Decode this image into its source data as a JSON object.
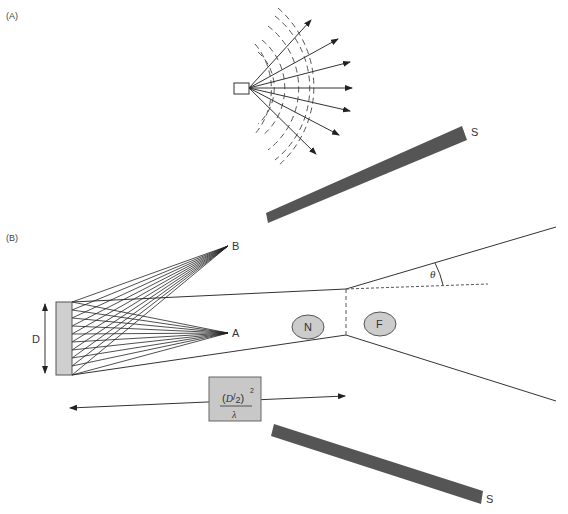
{
  "panel_a": {
    "label": "(A)",
    "surface_label": "S"
  },
  "panel_b": {
    "label": "(B)",
    "point_b_label": "B",
    "point_a_label": "A",
    "aperture_label": "D",
    "near_field_label": "N",
    "far_field_label": "F",
    "angle_label": "θ",
    "distance_formula": {
      "numerator_open": "(",
      "numerator_d": "D",
      "numerator_slash": "/",
      "numerator_two": "2",
      "numerator_close": ")",
      "exponent": "2",
      "denominator": "λ"
    },
    "surface_label": "S"
  },
  "colors": {
    "line": "#333333",
    "surface_fill": "#555555",
    "ellipse_fill": "#cccccc",
    "box_fill": "#c8c8c8",
    "aperture_fill": "#cfcfcf"
  }
}
